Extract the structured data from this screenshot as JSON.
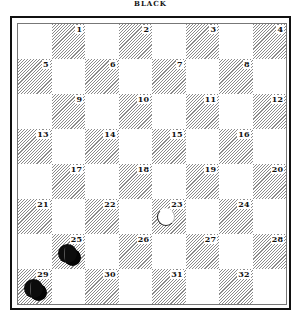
{
  "title": "BLACK",
  "board": {
    "rows": 8,
    "cols": 8,
    "colors": {
      "dark_hatch": "#8a8a8a",
      "light": "#ffffff",
      "border": "#111111"
    },
    "squares": [
      {
        "num": "1",
        "row": 0,
        "col": 1
      },
      {
        "num": "2",
        "row": 0,
        "col": 3
      },
      {
        "num": "3",
        "row": 0,
        "col": 5
      },
      {
        "num": "4",
        "row": 0,
        "col": 7
      },
      {
        "num": "5",
        "row": 1,
        "col": 0
      },
      {
        "num": "6",
        "row": 1,
        "col": 2
      },
      {
        "num": "7",
        "row": 1,
        "col": 4
      },
      {
        "num": "8",
        "row": 1,
        "col": 6
      },
      {
        "num": "9",
        "row": 2,
        "col": 1
      },
      {
        "num": "10",
        "row": 2,
        "col": 3
      },
      {
        "num": "11",
        "row": 2,
        "col": 5
      },
      {
        "num": "12",
        "row": 2,
        "col": 7
      },
      {
        "num": "13",
        "row": 3,
        "col": 0
      },
      {
        "num": "14",
        "row": 3,
        "col": 2
      },
      {
        "num": "15",
        "row": 3,
        "col": 4
      },
      {
        "num": "16",
        "row": 3,
        "col": 6
      },
      {
        "num": "17",
        "row": 4,
        "col": 1
      },
      {
        "num": "18",
        "row": 4,
        "col": 3
      },
      {
        "num": "19",
        "row": 4,
        "col": 5
      },
      {
        "num": "20",
        "row": 4,
        "col": 7
      },
      {
        "num": "21",
        "row": 5,
        "col": 0
      },
      {
        "num": "22",
        "row": 5,
        "col": 2
      },
      {
        "num": "23",
        "row": 5,
        "col": 4
      },
      {
        "num": "24",
        "row": 5,
        "col": 6
      },
      {
        "num": "25",
        "row": 6,
        "col": 1
      },
      {
        "num": "26",
        "row": 6,
        "col": 3
      },
      {
        "num": "27",
        "row": 6,
        "col": 5
      },
      {
        "num": "28",
        "row": 6,
        "col": 7
      },
      {
        "num": "29",
        "row": 7,
        "col": 0
      },
      {
        "num": "30",
        "row": 7,
        "col": 2
      },
      {
        "num": "31",
        "row": 7,
        "col": 4
      },
      {
        "num": "32",
        "row": 7,
        "col": 6
      }
    ],
    "pieces": [
      {
        "square": "25",
        "color": "black",
        "type": "king"
      },
      {
        "square": "29",
        "color": "black",
        "type": "king"
      },
      {
        "square": "23",
        "color": "white",
        "type": "man"
      }
    ]
  }
}
